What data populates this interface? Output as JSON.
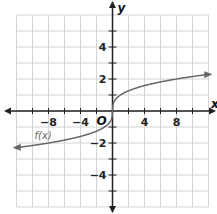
{
  "chart_data": {
    "type": "line",
    "title": "",
    "xlabel": "x",
    "ylabel": "y",
    "origin_label": "O",
    "xlim": [
      -12,
      12
    ],
    "ylim": [
      -6,
      6
    ],
    "grid": true,
    "x_grid_step": 2,
    "y_grid_step": 1,
    "x_tick_labels": [
      "-8",
      "-4",
      "4",
      "8"
    ],
    "x_tick_values": [
      -8,
      -4,
      4,
      8
    ],
    "y_tick_labels": [
      "4",
      "2",
      "-2",
      "-4"
    ],
    "y_tick_values": [
      4,
      2,
      -2,
      -4
    ],
    "series": [
      {
        "name": "f(x)",
        "function": "cube root of x",
        "x": [
          -12,
          -8,
          -4,
          -1,
          0,
          1,
          4,
          8,
          12
        ],
        "y": [
          -2.29,
          -2,
          -1.59,
          -1,
          0,
          1,
          1.59,
          2,
          2.29
        ],
        "arrows_both_ends": true,
        "color": "#666666"
      }
    ],
    "legend": "none",
    "annotations": [
      {
        "text": "f(x)",
        "x": -9,
        "y": -1
      }
    ]
  }
}
